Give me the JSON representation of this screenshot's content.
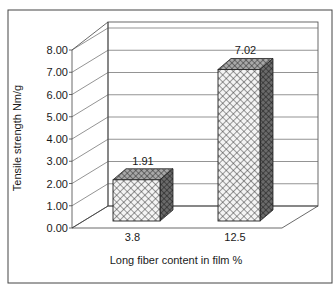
{
  "chart_data": {
    "type": "bar",
    "style": "3d-column",
    "title": "",
    "xlabel": "Long fiber content in film %",
    "ylabel": "Tensile strength Nm/g",
    "categories": [
      "3.8",
      "12.5"
    ],
    "values": [
      1.91,
      7.02
    ],
    "data_labels": [
      "1.91",
      "7.02"
    ],
    "ylim": [
      0,
      8
    ],
    "yticks": [
      "0.00",
      "1.00",
      "2.00",
      "3.00",
      "4.00",
      "5.00",
      "6.00",
      "7.00",
      "8.00"
    ],
    "grid": true,
    "legend": "none",
    "fill_pattern": "crosshatch",
    "colors": {
      "front": "#d8d8d8",
      "side": "#555555",
      "top": "#8a8a8a",
      "line": "#222222",
      "grid": "#555555"
    }
  }
}
